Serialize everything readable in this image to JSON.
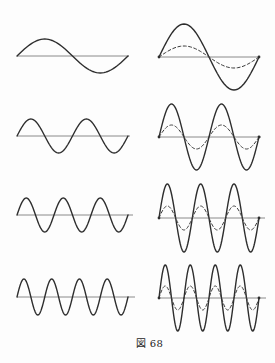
{
  "caption": "図 68",
  "colors": {
    "background": "#fdfdfd",
    "wave": "#2e2e2e",
    "dashed_wave": "#3a3a3a",
    "axis": "#8a8a8a",
    "dot": "#2e2e2e"
  },
  "figure": {
    "panels": [
      {
        "id": "left-row1",
        "column": "left",
        "row": 1,
        "cycles": 1,
        "x": 17,
        "axis_y": 56,
        "width": 111,
        "amplitude": 17,
        "dashed_amplitude": 0,
        "axis_overhang": 1,
        "endpoint_dots": false
      },
      {
        "id": "right-row1",
        "column": "right",
        "row": 1,
        "cycles": 1,
        "x": 159,
        "axis_y": 57,
        "width": 100,
        "amplitude": 33,
        "dashed_amplitude": 11,
        "axis_overhang": 1,
        "endpoint_dots": true
      },
      {
        "id": "left-row2",
        "column": "left",
        "row": 2,
        "cycles": 2,
        "x": 17,
        "axis_y": 136,
        "width": 111,
        "amplitude": 17,
        "dashed_amplitude": 0,
        "axis_overhang": 2,
        "endpoint_dots": false
      },
      {
        "id": "right-row2",
        "column": "right",
        "row": 2,
        "cycles": 2,
        "x": 159,
        "axis_y": 137,
        "width": 100,
        "amplitude": 33,
        "dashed_amplitude": 12,
        "axis_overhang": 2,
        "endpoint_dots": true
      },
      {
        "id": "left-row3",
        "column": "left",
        "row": 3,
        "cycles": 3,
        "x": 17,
        "axis_y": 215,
        "width": 111,
        "amplitude": 17,
        "dashed_amplitude": 0,
        "axis_overhang": 5,
        "endpoint_dots": false
      },
      {
        "id": "right-row3",
        "column": "right",
        "row": 3,
        "cycles": 3,
        "x": 159,
        "axis_y": 218,
        "width": 100,
        "amplitude": 34,
        "dashed_amplitude": 12,
        "axis_overhang": 6,
        "endpoint_dots": true
      },
      {
        "id": "left-row4",
        "column": "left",
        "row": 4,
        "cycles": 4,
        "x": 17,
        "axis_y": 297,
        "width": 111,
        "amplitude": 18,
        "dashed_amplitude": 0,
        "axis_overhang": 7,
        "endpoint_dots": false
      },
      {
        "id": "right-row4",
        "column": "right",
        "row": 4,
        "cycles": 4,
        "x": 159,
        "axis_y": 298,
        "width": 100,
        "amplitude": 33,
        "dashed_amplitude": 12,
        "axis_overhang": 7,
        "endpoint_dots": true
      }
    ]
  }
}
